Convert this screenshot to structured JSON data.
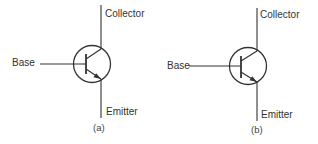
{
  "diagram": {
    "figures": [
      {
        "id": "a",
        "caption": "(a)",
        "labels": {
          "base": "Base",
          "collector": "Collector",
          "emitter": "Emitter"
        },
        "symbol": "npn-transistor"
      },
      {
        "id": "b",
        "caption": "(b)",
        "labels": {
          "base": "Base",
          "collector": "Collector",
          "emitter": "Emitter"
        },
        "symbol": "npn-transistor"
      }
    ],
    "colors": {
      "line": "#333333",
      "text": "#333333",
      "background": "#ffffff"
    }
  }
}
